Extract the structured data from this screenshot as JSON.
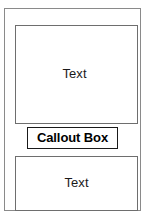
{
  "diagram": {
    "outer_frame": {
      "name": "outer-frame"
    },
    "boxes": [
      {
        "id": "top-box",
        "label": "Text",
        "border_color": "#6e6e6e",
        "fill_color": "#ffffff"
      },
      {
        "id": "bottom-box",
        "label": "Text",
        "border_color": "#6e6e6e",
        "fill_color": "#ffffff"
      }
    ],
    "callout": {
      "id": "callout-box",
      "label": "Callout Box",
      "border_color": "#1a1a1a",
      "fill_color": "#ffffff",
      "text_color": "#000000"
    },
    "background_color": "#ffffff"
  }
}
